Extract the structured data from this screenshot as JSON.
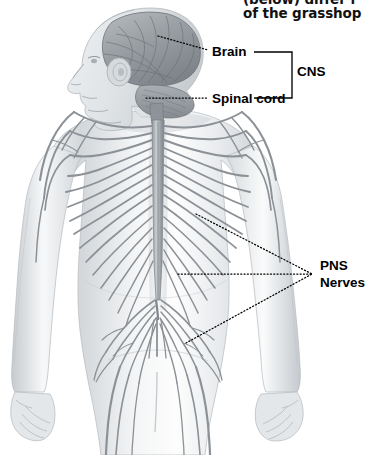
{
  "figure": {
    "title_fragment_line1": "(below) differ f",
    "title_fragment_line2": "of the grasshop",
    "view": "posterior-view-of-human-body-with-head-in-profile",
    "background_color": "#ffffff",
    "ink_color": "#000000",
    "anatomy_gray": "#8c9196",
    "body_shade": "#d9dcdf"
  },
  "labels": {
    "brain": "Brain",
    "spinal_cord": "Spinal cord",
    "cns": "CNS",
    "pns": "PNS",
    "nerves": "Nerves"
  },
  "leader_lines": {
    "brain": "dotted-diagonal-from-cerebrum-to-brain-label",
    "spinal_cord": "dotted-horizontal-from-cervical-cord-to-spinal-cord-label",
    "pns_upper": "dotted-diagonal-from-thoracic-nerves-to-pns-label",
    "pns_middle": "dotted-horizontal-from-lumbar-nerves-to-pns-label",
    "pns_lower": "dotted-diagonal-from-sacral-nerves-to-pns-label"
  },
  "brackets": {
    "cns": "right-angle-bracket-grouping-brain-and-spinal-cord"
  },
  "anatomy_parts": [
    {
      "name": "cerebrum",
      "region": "head"
    },
    {
      "name": "cerebellum",
      "region": "head"
    },
    {
      "name": "brain-stem",
      "region": "head"
    },
    {
      "name": "spinal-cord",
      "region": "torso"
    },
    {
      "name": "cervical-nerves",
      "region": "neck"
    },
    {
      "name": "brachial-plexus",
      "region": "shoulder"
    },
    {
      "name": "thoracic-spinal-nerves",
      "region": "torso"
    },
    {
      "name": "lumbar-nerves",
      "region": "lower-back"
    },
    {
      "name": "cauda-equina",
      "region": "lower-back"
    },
    {
      "name": "sacral-nerves",
      "region": "pelvis"
    },
    {
      "name": "left-arm",
      "region": "limb"
    },
    {
      "name": "right-arm",
      "region": "limb"
    },
    {
      "name": "left-hand",
      "region": "limb"
    },
    {
      "name": "right-hand",
      "region": "limb"
    }
  ]
}
